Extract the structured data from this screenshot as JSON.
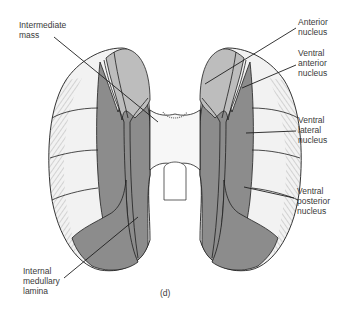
{
  "figure": {
    "caption": "(d)",
    "colors": {
      "dark_gray": "#8c8c8c",
      "mid_gray": "#a9a9a9",
      "light_gray": "#bdbdbd",
      "pale": "#f2f2f2",
      "outline": "#1e1e1e",
      "text": "#3a3a3a"
    },
    "labels": [
      {
        "id": "intermediate-mass",
        "text": "Intermediate\nmass"
      },
      {
        "id": "anterior-nucleus",
        "text": "Anterior\nnucleus"
      },
      {
        "id": "ventral-anterior-nucleus",
        "text": "Ventral\nanterior\nnucleus"
      },
      {
        "id": "ventral-lateral-nucleus",
        "text": "Ventral\nlateral\nnucleus"
      },
      {
        "id": "ventral-posterior-nucleus",
        "text": "Ventral\nposterior\nnucleus"
      },
      {
        "id": "internal-medullary-lamina",
        "text": "Internal\nmedullary\nlamina"
      }
    ]
  }
}
